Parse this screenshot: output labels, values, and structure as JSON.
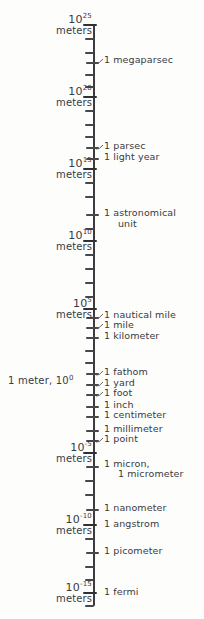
{
  "figure": {
    "orientation": "vertical",
    "axis_color": "#3c3c40",
    "background_color": "#fdfdfc",
    "text_color": "#3a3a3e"
  },
  "chart_data": {
    "type": "scatter",
    "xlabel": "",
    "ylabel": "meters",
    "axis_scale": "log10",
    "axis_orientation": "vertical",
    "grid": false,
    "legend": null,
    "ylim": [
      -15,
      25
    ],
    "tick_step": 1,
    "decade_labels": [
      {
        "exponent": 25,
        "text": "10",
        "sup": "25",
        "unit": "meters",
        "y": 24
      },
      {
        "exponent": 20,
        "text": "10",
        "sup": "20",
        "unit": "meters",
        "y": 96
      },
      {
        "exponent": 15,
        "text": "10",
        "sup": "15",
        "unit": "meters",
        "y": 168
      },
      {
        "exponent": 10,
        "text": "10",
        "sup": "10",
        "unit": "meters",
        "y": 240
      },
      {
        "exponent": 5,
        "text": "10",
        "sup": "5",
        "unit": "meters",
        "y": 308
      },
      {
        "exponent": -5,
        "text": "10",
        "sup": "-5",
        "unit": "meters",
        "y": 452
      },
      {
        "exponent": -10,
        "text": "10",
        "sup": "-10",
        "unit": "meters",
        "y": 524
      },
      {
        "exponent": -15,
        "text": "10",
        "sup": "-15",
        "unit": "meters",
        "y": 592
      }
    ],
    "origin_label": {
      "meter_text": "1 meter,",
      "power_text": "10",
      "power_sup": "0",
      "exponent": 0,
      "y": 380
    },
    "annotations": [
      {
        "label": "1 megaparsec",
        "exponent": 22.5,
        "y": 60,
        "leader": true,
        "indent": false
      },
      {
        "label": "1 parsec",
        "exponent": 16.5,
        "y": 146,
        "leader": true,
        "indent": false
      },
      {
        "label": "1 light year",
        "exponent": 16,
        "y": 157,
        "leader": false,
        "indent": false
      },
      {
        "label": "1 astronomical",
        "exponent": 11,
        "y": 213,
        "leader": false,
        "indent": false
      },
      {
        "label": "unit",
        "exponent": 11,
        "y": 224,
        "leader": false,
        "indent": true
      },
      {
        "label": "1 nautical mile",
        "exponent": 3.3,
        "y": 315,
        "leader": true,
        "indent": false
      },
      {
        "label": "1 mile",
        "exponent": 3.2,
        "y": 325,
        "leader": true,
        "indent": false
      },
      {
        "label": "1 kilometer",
        "exponent": 3,
        "y": 336,
        "leader": false,
        "indent": false
      },
      {
        "label": "1 fathom",
        "exponent": 0.3,
        "y": 372,
        "leader": true,
        "indent": false
      },
      {
        "label": "1 yard",
        "exponent": -0.04,
        "y": 383,
        "leader": true,
        "indent": false
      },
      {
        "label": "1 foot",
        "exponent": -0.5,
        "y": 393,
        "leader": true,
        "indent": false
      },
      {
        "label": "1 inch",
        "exponent": -1.6,
        "y": 405,
        "leader": false,
        "indent": false
      },
      {
        "label": "1 centimeter",
        "exponent": -2,
        "y": 415,
        "leader": false,
        "indent": false
      },
      {
        "label": "1 millimeter",
        "exponent": -3,
        "y": 429,
        "leader": false,
        "indent": false
      },
      {
        "label": "1 point",
        "exponent": -3.5,
        "y": 439,
        "leader": true,
        "indent": false
      },
      {
        "label": "1 micron,",
        "exponent": -6,
        "y": 464,
        "leader": false,
        "indent": false
      },
      {
        "label": "1 micrometer",
        "exponent": -6,
        "y": 474,
        "leader": false,
        "indent": true
      },
      {
        "label": "1 nanometer",
        "exponent": -9,
        "y": 508,
        "leader": false,
        "indent": false
      },
      {
        "label": "1 angstrom",
        "exponent": -10,
        "y": 524,
        "leader": false,
        "indent": false
      },
      {
        "label": "1 picometer",
        "exponent": -12,
        "y": 551,
        "leader": false,
        "indent": false
      },
      {
        "label": "1 fermi",
        "exponent": -15,
        "y": 592,
        "leader": false,
        "indent": false
      }
    ],
    "ticks": [
      {
        "y": 24,
        "kind": "major"
      },
      {
        "y": 38,
        "kind": "minor"
      },
      {
        "y": 52,
        "kind": "minor"
      },
      {
        "y": 62,
        "kind": "cross"
      },
      {
        "y": 74,
        "kind": "minor"
      },
      {
        "y": 86,
        "kind": "minor"
      },
      {
        "y": 96,
        "kind": "major"
      },
      {
        "y": 110,
        "kind": "minor"
      },
      {
        "y": 124,
        "kind": "minor"
      },
      {
        "y": 136,
        "kind": "minor"
      },
      {
        "y": 147,
        "kind": "cross"
      },
      {
        "y": 158,
        "kind": "cross"
      },
      {
        "y": 168,
        "kind": "major"
      },
      {
        "y": 182,
        "kind": "minor"
      },
      {
        "y": 196,
        "kind": "minor"
      },
      {
        "y": 214,
        "kind": "cross"
      },
      {
        "y": 228,
        "kind": "minor"
      },
      {
        "y": 240,
        "kind": "major"
      },
      {
        "y": 254,
        "kind": "minor"
      },
      {
        "y": 268,
        "kind": "minor"
      },
      {
        "y": 282,
        "kind": "minor"
      },
      {
        "y": 296,
        "kind": "minor"
      },
      {
        "y": 308,
        "kind": "major"
      },
      {
        "y": 317,
        "kind": "cross"
      },
      {
        "y": 327,
        "kind": "cross"
      },
      {
        "y": 337,
        "kind": "cross"
      },
      {
        "y": 350,
        "kind": "minor"
      },
      {
        "y": 362,
        "kind": "minor"
      },
      {
        "y": 373,
        "kind": "cross"
      },
      {
        "y": 384,
        "kind": "cross"
      },
      {
        "y": 394,
        "kind": "cross"
      },
      {
        "y": 406,
        "kind": "cross"
      },
      {
        "y": 416,
        "kind": "cross"
      },
      {
        "y": 430,
        "kind": "cross"
      },
      {
        "y": 440,
        "kind": "cross"
      },
      {
        "y": 452,
        "kind": "major"
      },
      {
        "y": 466,
        "kind": "cross"
      },
      {
        "y": 480,
        "kind": "minor"
      },
      {
        "y": 494,
        "kind": "minor"
      },
      {
        "y": 509,
        "kind": "cross"
      },
      {
        "y": 524,
        "kind": "major"
      },
      {
        "y": 538,
        "kind": "minor"
      },
      {
        "y": 552,
        "kind": "cross"
      },
      {
        "y": 566,
        "kind": "minor"
      },
      {
        "y": 579,
        "kind": "minor"
      },
      {
        "y": 592,
        "kind": "major"
      },
      {
        "y": 605,
        "kind": "minor"
      }
    ]
  }
}
